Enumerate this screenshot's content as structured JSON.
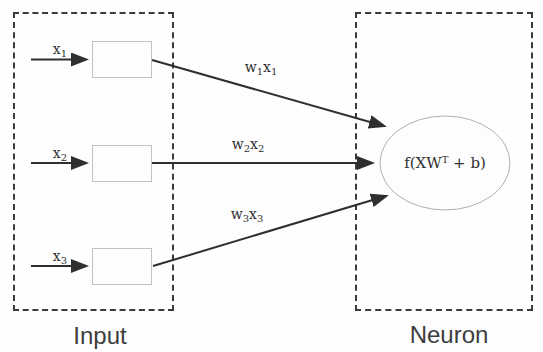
{
  "diagram": {
    "title_semantic": "single artificial neuron with three weighted inputs",
    "input_group": {
      "caption": "Input",
      "rows": [
        {
          "input_label": {
            "base": "x",
            "sub": "1"
          },
          "weight_label": {
            "w": "w",
            "wsub": "1",
            "x": "x",
            "xsub": "1"
          }
        },
        {
          "input_label": {
            "base": "x",
            "sub": "2"
          },
          "weight_label": {
            "w": "w",
            "wsub": "2",
            "x": "x",
            "xsub": "2"
          }
        },
        {
          "input_label": {
            "base": "x",
            "sub": "3"
          },
          "weight_label": {
            "w": "w",
            "wsub": "3",
            "x": "x",
            "xsub": "3"
          }
        }
      ]
    },
    "neuron_group": {
      "caption": "Neuron",
      "formula": {
        "pre": "f(XW",
        "sup": "T",
        "post": " + b)"
      }
    },
    "colors": {
      "arrow_line": "#2f2f2f",
      "dashed_border": "#3b3b3b",
      "box_border": "#c2c2c2",
      "ellipse_border": "#b0b0b0",
      "caption_text": "#3d3d3d",
      "background": "#fefefe"
    }
  }
}
